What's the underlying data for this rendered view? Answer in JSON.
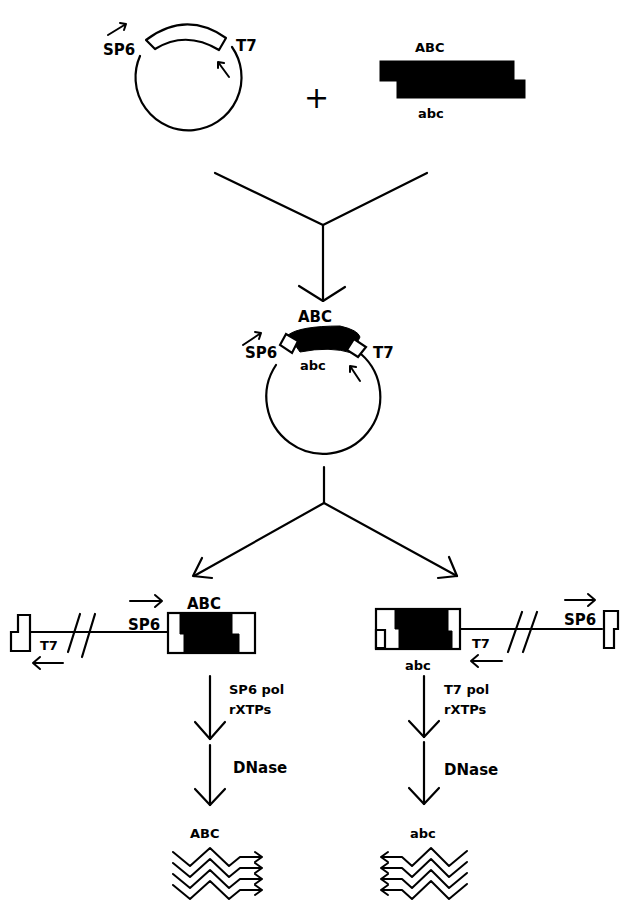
{
  "diagram": {
    "colors": {
      "ink": "#000000",
      "background": "#ffffff"
    },
    "step1": {
      "vector": {
        "left_promoter": "SP6",
        "right_promoter": "T7"
      },
      "operator": "+",
      "insert": {
        "top_strand": "ABC",
        "bottom_strand": "abc"
      }
    },
    "step2": {
      "recombinant": {
        "left_promoter": "SP6",
        "right_promoter": "T7",
        "top_strand": "ABC",
        "bottom_strand": "abc"
      }
    },
    "step3": {
      "left": {
        "far_promoter": "T7",
        "near_promoter": "SP6",
        "insert_label": "ABC",
        "reaction": {
          "line1": "SP6 pol",
          "line2": "rXTPs"
        },
        "digestion": "DNase",
        "product_label": "ABC",
        "product_direction": "right"
      },
      "right": {
        "far_promoter": "SP6",
        "near_promoter": "T7",
        "insert_label": "abc",
        "reaction": {
          "line1": "T7 pol",
          "line2": "rXTPs"
        },
        "digestion": "DNase",
        "product_label": "abc",
        "product_direction": "left"
      }
    }
  }
}
